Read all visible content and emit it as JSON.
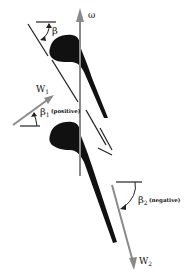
{
  "diagram": {
    "type": "turbine blade velocity triangle",
    "labels": {
      "omega": "ω",
      "beta": "β",
      "w1": "W",
      "w1_sub": "1",
      "beta1": "β",
      "beta1_sub": "1",
      "beta1_note": "(positive)",
      "beta2": "β",
      "beta2_sub": "2",
      "beta2_note": "(negative)",
      "w2": "W",
      "w2_sub": "2"
    },
    "colors": {
      "blade": "#111111",
      "arrow_gray": "#8a8a8a",
      "line": "#222222"
    }
  }
}
